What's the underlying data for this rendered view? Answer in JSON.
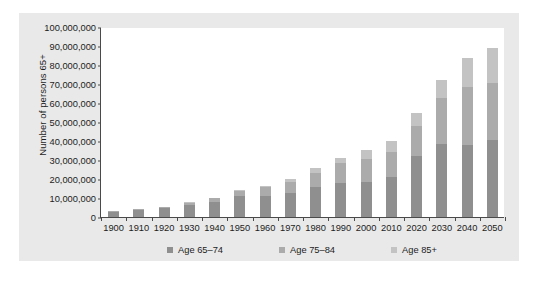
{
  "chart_data": {
    "type": "bar",
    "title": "",
    "subtitle": "",
    "xlabel": "",
    "ylabel": "Number of persons 65+",
    "stacked": true,
    "grid": false,
    "legend_position": "bottom",
    "ylim": [
      0,
      100000000
    ],
    "ytick_values": [
      0,
      10000000,
      20000000,
      30000000,
      40000000,
      50000000,
      60000000,
      70000000,
      80000000,
      90000000,
      100000000
    ],
    "ytick_labels": [
      "0",
      "10,000,000",
      "20,000,000",
      "30,000,000",
      "40,000,000",
      "50,000,000",
      "60,000,000",
      "70,000,000",
      "80,000,000",
      "90,000,000",
      "100,000,000"
    ],
    "categories": [
      "1900",
      "1910",
      "1920",
      "1930",
      "1940",
      "1950",
      "1960",
      "1970",
      "1980",
      "1990",
      "2000",
      "2010",
      "2020",
      "2030",
      "2040",
      "2050"
    ],
    "series": [
      {
        "name": "Age 65–74",
        "color": "#8f8f8f",
        "values": [
          2700000,
          3600000,
          4500000,
          6300000,
          8000000,
          11000000,
          11000000,
          12500000,
          15600000,
          18100000,
          18400000,
          21000000,
          32300000,
          38300000,
          37700000,
          40600000
        ]
      },
      {
        "name": "Age 75–84",
        "color": "#ababab",
        "values": [
          400000,
          600000,
          800000,
          1300000,
          1800000,
          2800000,
          4600000,
          6100000,
          7700000,
          10100000,
          12400000,
          13100000,
          15700000,
          24600000,
          30700000,
          30200000
        ]
      },
      {
        "name": "Age 85+",
        "color": "#c3c3c3",
        "values": [
          100000,
          200000,
          200000,
          300000,
          400000,
          600000,
          900000,
          1500000,
          2300000,
          3100000,
          4300000,
          5800000,
          6700000,
          9100000,
          15400000,
          18200000
        ]
      }
    ],
    "totals": [
      3200000,
      4400000,
      5500000,
      7900000,
      10200000,
      14400000,
      16500000,
      20100000,
      25600000,
      31300000,
      35100000,
      39900000,
      54700000,
      72000000,
      83800000,
      89000000
    ]
  },
  "legend": {
    "items": [
      {
        "label": "Age 65–74",
        "color": "#8f8f8f"
      },
      {
        "label": "Age 75–84",
        "color": "#ababab"
      },
      {
        "label": "Age 85+",
        "color": "#c3c3c3"
      }
    ]
  },
  "caption": {
    "text": ""
  }
}
